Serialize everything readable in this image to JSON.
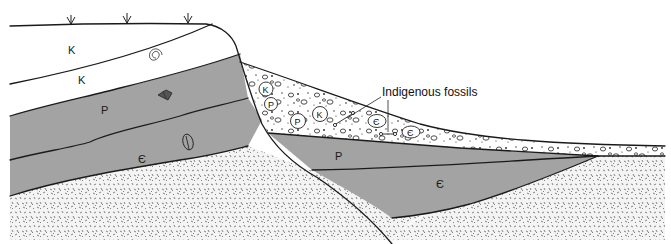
{
  "diagram": {
    "type": "geologic cross-section",
    "callout": {
      "label": "Indigenous fossils"
    },
    "colors": {
      "upper_layers": "#ffffff",
      "paleozoic_layers": "#a3a3a3",
      "basement": "#f2f2f2",
      "basement_speckle": "#555555",
      "conglomerate": "#ffffff",
      "outline": "#1a1a1a"
    },
    "units": {
      "left_block": [
        {
          "symbol": "K",
          "fill": "white",
          "fossil": "none"
        },
        {
          "symbol": "K",
          "fill": "white",
          "fossil": "ammonite-icon"
        },
        {
          "symbol": "P",
          "fill": "gray",
          "fossil": "brachiopod-icon"
        },
        {
          "symbol": "Є",
          "fill": "gray",
          "fossil": "trilobite-icon"
        }
      ],
      "right_block": [
        {
          "symbol": "P",
          "fill": "gray"
        },
        {
          "symbol": "Є",
          "fill": "gray"
        }
      ],
      "conglomerate_clasts": [
        "K",
        "P",
        "P",
        "K",
        "Є",
        "Є"
      ],
      "conglomerate_fossils": [
        "bone-icon",
        "bone-icon"
      ]
    },
    "surface_features": [
      "plant-icon",
      "plant-icon",
      "plant-icon"
    ]
  }
}
